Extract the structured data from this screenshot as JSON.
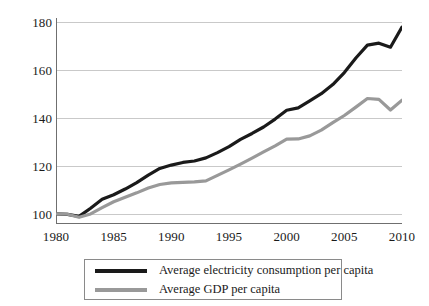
{
  "chart_data": {
    "type": "line",
    "title": "",
    "subtitle": "",
    "xlabel": "",
    "ylabel": "",
    "xlim": [
      1980,
      2010
    ],
    "ylim": [
      96,
      182
    ],
    "y_ticks": [
      100,
      120,
      140,
      160,
      180
    ],
    "x_ticks": [
      1980,
      1985,
      1990,
      1995,
      2000,
      2005,
      2010
    ],
    "grid": "horizontal",
    "legend_position": "below-axis",
    "index_base": 100,
    "x": [
      1980,
      1981,
      1982,
      1983,
      1984,
      1985,
      1986,
      1987,
      1988,
      1989,
      1990,
      1991,
      1992,
      1993,
      1994,
      1995,
      1996,
      1997,
      1998,
      1999,
      2000,
      2001,
      2002,
      2003,
      2004,
      2005,
      2006,
      2007,
      2008,
      2009,
      2010
    ],
    "series": [
      {
        "name": "Average electricity consumption per capita",
        "color": "#1a1a1a",
        "width": 3.2,
        "values": [
          100.2,
          100.0,
          99.2,
          102.6,
          106.3,
          108.2,
          110.6,
          113.3,
          116.4,
          119.2,
          120.6,
          121.7,
          122.3,
          123.6,
          125.8,
          128.3,
          131.3,
          133.8,
          136.5,
          139.8,
          143.5,
          144.5,
          147.4,
          150.4,
          154.2,
          159.2,
          165.3,
          170.7,
          171.5,
          169.8,
          178.2
        ]
      },
      {
        "name": "Average GDP per capita",
        "color": "#999999",
        "width": 3.2,
        "values": [
          100.2,
          100.1,
          98.8,
          100.2,
          102.8,
          105.3,
          107.2,
          109.0,
          111.0,
          112.5,
          113.2,
          113.4,
          113.6,
          114.0,
          116.3,
          118.6,
          121.0,
          123.5,
          126.1,
          128.6,
          131.4,
          131.5,
          132.8,
          135.2,
          138.3,
          141.3,
          144.8,
          148.4,
          148.0,
          143.6,
          147.7
        ]
      }
    ]
  },
  "axes": {
    "y_tick_labels": [
      "180",
      "160",
      "140",
      "120",
      "100"
    ],
    "x_tick_labels": [
      "1980",
      "1985",
      "1990",
      "1995",
      "2000",
      "2005",
      "2010"
    ]
  },
  "legend": {
    "entries": [
      {
        "label": "Average electricity consumption per capita",
        "color": "#1a1a1a"
      },
      {
        "label": "Average GDP per capita",
        "color": "#999999"
      }
    ]
  },
  "colors": {
    "electricity": "#1a1a1a",
    "gdp": "#999999",
    "grid": "#c9c9c9",
    "axis": "#6f6f6f",
    "legend_border": "#8a8a8a",
    "background": "#ffffff"
  }
}
